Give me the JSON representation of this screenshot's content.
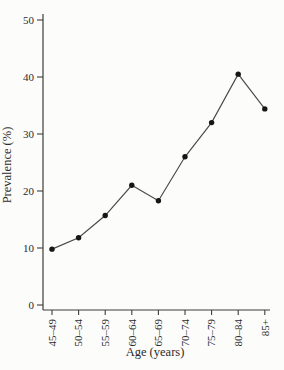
{
  "chart_data": {
    "type": "line",
    "title": "",
    "xlabel": "Age (years)",
    "ylabel": "Prevalence (%)",
    "categories": [
      "45–49",
      "50–54",
      "55–59",
      "60–64",
      "65–69",
      "70–74",
      "75–79",
      "80–84",
      "85+"
    ],
    "values": [
      9.8,
      11.8,
      15.7,
      21,
      18.3,
      26,
      32,
      40.5,
      34.4
    ],
    "ylim": [
      0,
      50
    ],
    "yticks": [
      0,
      10,
      20,
      30,
      40,
      50
    ],
    "grid": false,
    "legend": "none",
    "marker": "filled-circle",
    "colors": {
      "line": "#4a4a4a",
      "marker": "#161616",
      "axis": "#3c3c3c",
      "text": "#2b2b2b",
      "background": "#fcfcfb"
    }
  }
}
